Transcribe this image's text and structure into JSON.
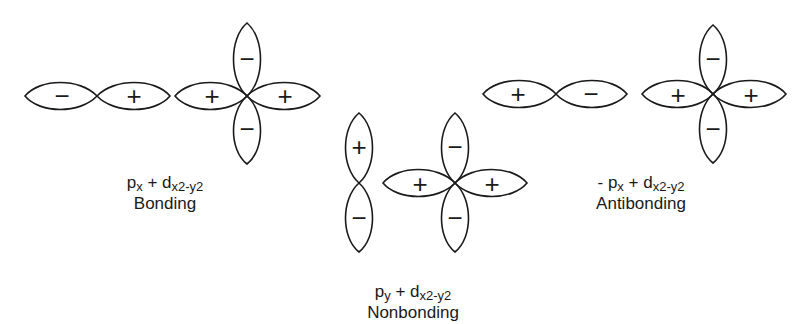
{
  "diagram": {
    "groups": [
      {
        "id": "bonding",
        "p_orbital": {
          "orientation": "horizontal",
          "left_sign": "−",
          "right_sign": "+"
        },
        "d_orbital": {
          "left": "+",
          "right": "+",
          "top": "−",
          "bottom": "−"
        },
        "label_line1": {
          "prefix": "",
          "p": "p",
          "p_sub": "x",
          "plus": " + ",
          "d": "d",
          "d_sub": "x2-y2"
        },
        "label_line2": "Bonding"
      },
      {
        "id": "nonbonding",
        "p_orbital": {
          "orientation": "vertical",
          "top_sign": "+",
          "bottom_sign": "−"
        },
        "d_orbital": {
          "left": "+",
          "right": "+",
          "top": "−",
          "bottom": "−"
        },
        "label_line1": {
          "prefix": "",
          "p": "p",
          "p_sub": "y",
          "plus": " + ",
          "d": "d",
          "d_sub": "x2-y2"
        },
        "label_line2": "Nonbonding"
      },
      {
        "id": "antibonding",
        "p_orbital": {
          "orientation": "horizontal",
          "left_sign": "+",
          "right_sign": "−"
        },
        "d_orbital": {
          "left": "+",
          "right": "+",
          "top": "−",
          "bottom": "−"
        },
        "label_line1": {
          "prefix": "- ",
          "p": "p",
          "p_sub": "x",
          "plus": " + ",
          "d": "d",
          "d_sub": "x2-y2"
        },
        "label_line2": "Antibonding"
      }
    ]
  }
}
